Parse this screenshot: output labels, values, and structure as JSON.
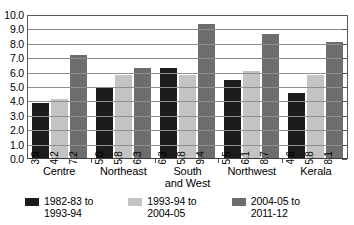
{
  "chart_data": {
    "type": "bar",
    "title": "",
    "subtitle": "",
    "xlabel": "",
    "ylabel": "",
    "ylim": [
      0.0,
      10.0
    ],
    "ytick_step": 1.0,
    "ytick_labels": [
      "10.0",
      "9.0",
      "8.0",
      "7.0",
      "6.0",
      "5.0",
      "4.0",
      "3.0",
      "2.0",
      "1.0",
      "0.0"
    ],
    "grid": "horizontal",
    "legend_position": "bottom",
    "categories": [
      "Centre",
      "Northeast",
      "South\nand West",
      "Northwest",
      "Kerala"
    ],
    "series": [
      {
        "name": "1982-83 to\n1993-94",
        "color": "#1c1c1c",
        "values": [
          3.9,
          5.0,
          6.3,
          5.5,
          4.6
        ],
        "labels": [
          "3.9",
          "5.0",
          "6.3",
          "5.5",
          "4.6"
        ]
      },
      {
        "name": "1993-94 to\n2004-05",
        "color": "#c3c3c3",
        "values": [
          4.2,
          5.8,
          5.8,
          6.1,
          5.8
        ],
        "labels": [
          "4.2",
          "5.8",
          "5.8",
          "6.1",
          "5.8"
        ]
      },
      {
        "name": "2004-05 to\n2011-12",
        "color": "#6d6d6d",
        "values": [
          7.2,
          6.3,
          9.4,
          8.7,
          8.1
        ],
        "labels": [
          "7.2",
          "6.3",
          "9.4",
          "8.7",
          "8.1"
        ]
      }
    ]
  },
  "colors": {
    "axis": "#55565a",
    "gridline": "#8d8f93",
    "background": "#ffffff",
    "series_1": "#1c1c1c",
    "series_2": "#c3c3c3",
    "series_3": "#6d6d6d"
  }
}
